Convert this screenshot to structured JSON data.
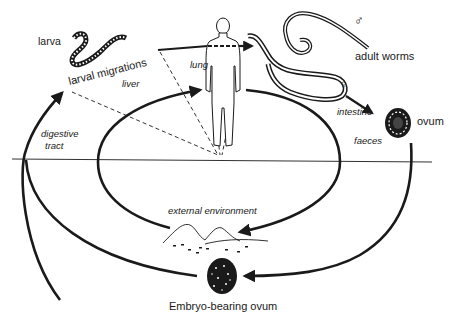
{
  "diagram": {
    "type": "life-cycle",
    "labels": {
      "larva": "larva",
      "larval_migrations": "larval migrations",
      "lung": "lung",
      "liver": "liver",
      "adult_worms": "adult worms",
      "male_symbol": "♂",
      "female_symbol": "♀",
      "intestine": "intestine",
      "ovum": "ovum",
      "faeces": "faeces",
      "digestive_tract": "digestive",
      "digestive_tract_2": "tract",
      "external_environment": "external environment",
      "embryo_bearing_ovum": "Embryo-bearing ovum"
    },
    "colors": {
      "line": "#1a1a1a",
      "background": "#ffffff"
    },
    "stages": [
      "larva",
      "larval migrations",
      "liver",
      "lung",
      "adult worms",
      "intestine",
      "ovum",
      "faeces",
      "external environment",
      "Embryo-bearing ovum",
      "digestive tract"
    ]
  }
}
